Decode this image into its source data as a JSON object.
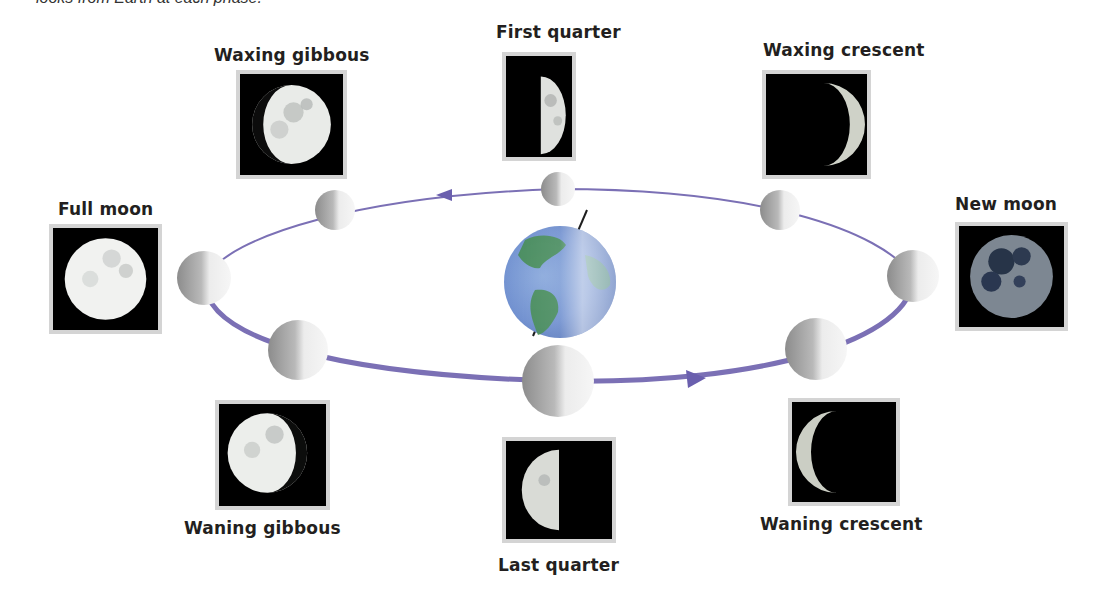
{
  "caption": "looks from Earth at each phase.",
  "diagram": {
    "center": "Earth",
    "orbit_color": "#7b70b5",
    "orbit_direction": "counterclockwise (arrow on far side points left, arrow on near side points right)",
    "phases": [
      {
        "id": "new-moon",
        "label": "New moon"
      },
      {
        "id": "waxing-crescent",
        "label": "Waxing crescent"
      },
      {
        "id": "first-quarter",
        "label": "First quarter"
      },
      {
        "id": "waxing-gibbous",
        "label": "Waxing gibbous"
      },
      {
        "id": "full-moon",
        "label": "Full moon"
      },
      {
        "id": "waning-gibbous",
        "label": "Waning gibbous"
      },
      {
        "id": "last-quarter",
        "label": "Last quarter"
      },
      {
        "id": "waning-crescent",
        "label": "Waning crescent"
      }
    ]
  }
}
